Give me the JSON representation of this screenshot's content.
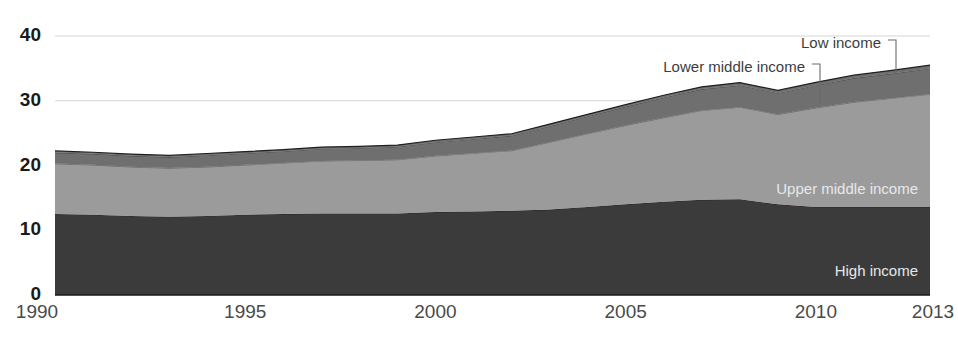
{
  "chart_data": {
    "type": "area",
    "stacked": true,
    "title": "",
    "subtitle": "",
    "xlabel": "",
    "ylabel": "",
    "xlim": [
      1990,
      2013
    ],
    "ylim": [
      0,
      40
    ],
    "grid": true,
    "grid_axis": "y",
    "legend_position": "inline-annotations",
    "x": [
      1990,
      1991,
      1992,
      1993,
      1994,
      1995,
      1996,
      1997,
      1998,
      1999,
      2000,
      2001,
      2002,
      2003,
      2004,
      2005,
      2006,
      2007,
      2008,
      2009,
      2010,
      2011,
      2012,
      2013
    ],
    "x_ticks": [
      1990,
      1995,
      2000,
      2005,
      2010,
      2013
    ],
    "y_ticks": [
      0,
      10,
      20,
      30,
      40
    ],
    "series": [
      {
        "name": "High income",
        "color": "#3b3b3b",
        "label_color": "#e8e8e8",
        "label_placement": "inside",
        "values": [
          12.5,
          12.4,
          12.2,
          12.1,
          12.2,
          12.4,
          12.5,
          12.6,
          12.6,
          12.6,
          12.8,
          12.9,
          13.0,
          13.2,
          13.6,
          14.0,
          14.4,
          14.7,
          14.8,
          14.0,
          13.6,
          13.6,
          13.6,
          13.6
        ]
      },
      {
        "name": "Upper middle income",
        "color": "#9b9b9b",
        "label_color": "#e8e8e8",
        "label_placement": "inside",
        "values": [
          7.8,
          7.7,
          7.6,
          7.5,
          7.6,
          7.7,
          7.9,
          8.1,
          8.2,
          8.3,
          8.7,
          9.0,
          9.3,
          10.4,
          11.3,
          12.2,
          13.0,
          13.8,
          14.2,
          13.9,
          15.3,
          16.2,
          16.8,
          17.4
        ]
      },
      {
        "name": "Lower middle income",
        "color": "#6f6f6f",
        "label_color": "#3d3d3d",
        "label_placement": "outside",
        "values": [
          1.7,
          1.7,
          1.7,
          1.7,
          1.8,
          1.8,
          1.8,
          1.9,
          1.9,
          2.0,
          2.1,
          2.2,
          2.3,
          2.5,
          2.7,
          2.9,
          3.1,
          3.3,
          3.4,
          3.3,
          3.5,
          3.7,
          3.8,
          4.0
        ]
      },
      {
        "name": "Low income",
        "color": "#6f6f6f",
        "label_color": "#3d3d3d",
        "label_placement": "outside",
        "values": [
          0.25,
          0.25,
          0.25,
          0.25,
          0.25,
          0.25,
          0.25,
          0.25,
          0.25,
          0.25,
          0.3,
          0.3,
          0.3,
          0.3,
          0.3,
          0.3,
          0.35,
          0.35,
          0.4,
          0.4,
          0.45,
          0.45,
          0.5,
          0.5
        ]
      }
    ],
    "totals": [
      22.25,
      22.05,
      21.75,
      21.55,
      21.85,
      22.15,
      22.45,
      22.85,
      22.95,
      23.15,
      23.9,
      24.4,
      24.9,
      26.4,
      27.9,
      29.4,
      30.85,
      32.15,
      32.8,
      31.6,
      32.85,
      33.95,
      34.7,
      35.5
    ]
  },
  "axes": {
    "y_tick_labels": [
      "0",
      "10",
      "20",
      "30",
      "40"
    ],
    "x_tick_labels": [
      "1990",
      "1995",
      "2000",
      "2005",
      "2010",
      "2013"
    ]
  },
  "annotations": {
    "low_income": "Low income",
    "lower_middle_income": "Lower middle income",
    "upper_middle_income": "Upper middle income",
    "high_income": "High income"
  },
  "colors": {
    "high_income": "#3b3b3b",
    "upper_middle_income": "#9b9b9b",
    "lower_middle_income": "#6f6f6f",
    "low_income": "#6f6f6f",
    "gridline": "#d5d5d5",
    "baseline": "#1a1a1a",
    "axis_text": "#4a4a4a",
    "background": "#ffffff"
  }
}
